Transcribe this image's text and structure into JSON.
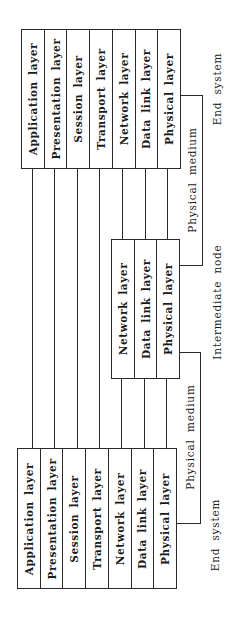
{
  "diagram": {
    "top_end_system": {
      "label": "End system",
      "layers": [
        "Application layer",
        "Presentation layer",
        "Session layer",
        "Transport layer",
        "Network layer",
        "Data link layer",
        "Physical layer"
      ]
    },
    "intermediate_node": {
      "label": "Intermediate node",
      "layers": [
        "Network layer",
        "Data link layer",
        "Physical layer"
      ]
    },
    "bottom_end_system": {
      "label": "End system",
      "layers": [
        "Application layer",
        "Presentation layer",
        "Session layer",
        "Transport layer",
        "Network layer",
        "Data link layer",
        "Physical layer"
      ]
    },
    "links": [
      {
        "label": "Physical medium"
      },
      {
        "label": "Physical medium"
      }
    ],
    "line_color": "#2a2a2a"
  }
}
